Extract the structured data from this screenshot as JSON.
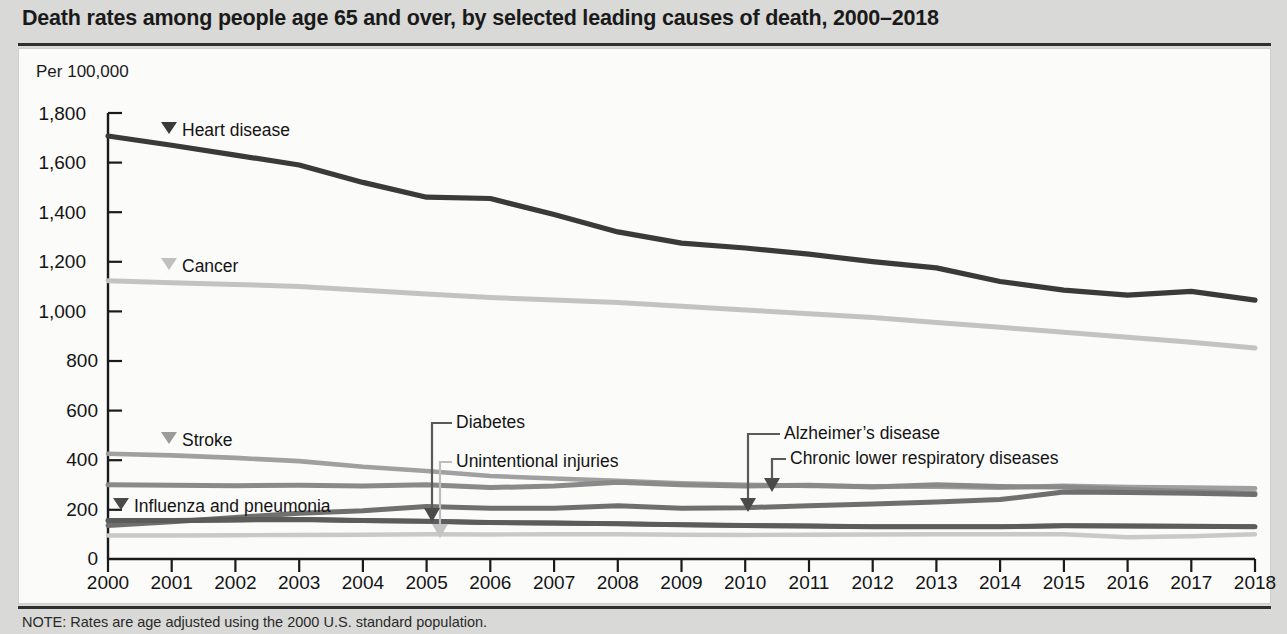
{
  "title": "Death rates among people age 65 and over, by selected leading causes of death, 2000–2018",
  "note": "NOTE: Rates are age adjusted using the 2000 U.S. standard population.",
  "axis_unit": "Per 100,000",
  "labels": {
    "heart": "Heart disease",
    "cancer": "Cancer",
    "stroke": "Stroke",
    "influenza": "Influenza and pneumonia",
    "diabetes": "Diabetes",
    "unintentional": "Unintentional injuries",
    "alzheimers": "Alzheimer’s disease",
    "clrd": "Chronic lower respiratory diseases"
  },
  "colors": {
    "heart": "#3a3a3a",
    "cancer": "#c3c3c3",
    "stroke": "#a0a0a0",
    "influenza": "#5c5c5c",
    "diabetes": "#4a4a4a",
    "unintentional": "#c9c9c9",
    "alzheimers": "#6f6f6f",
    "clrd": "#8a8a8a",
    "axis": "#1a1a1a",
    "panel_bg": "#fbfbfa",
    "page_bg": "#d9d9d7"
  },
  "chart_data": {
    "type": "line",
    "title": "Death rates among people age 65 and over, by selected leading causes of death, 2000–2018",
    "xlabel": "",
    "ylabel": "Per 100,000",
    "ylim": [
      0,
      1800
    ],
    "yticks": [
      0,
      200,
      400,
      600,
      800,
      1000,
      1200,
      1400,
      1600,
      1800
    ],
    "ytick_labels": [
      "0",
      "200",
      "400",
      "600",
      "800",
      "1,000",
      "1,200",
      "1,400",
      "1,600",
      "1,800"
    ],
    "grid": false,
    "legend": "inline-labels",
    "x": [
      2000,
      2001,
      2002,
      2003,
      2004,
      2005,
      2006,
      2007,
      2008,
      2009,
      2010,
      2011,
      2012,
      2013,
      2014,
      2015,
      2016,
      2017,
      2018
    ],
    "xtick_labels": [
      "2000",
      "2001",
      "2002",
      "2003",
      "2004",
      "2005",
      "2006",
      "2007",
      "2008",
      "2009",
      "2010",
      "2011",
      "2012",
      "2013",
      "2014",
      "2015",
      "2016",
      "2017",
      "2018"
    ],
    "series": [
      {
        "name": "Heart disease",
        "color": "#3a3a3a",
        "values": [
          1707,
          1670,
          1630,
          1590,
          1520,
          1460,
          1455,
          1390,
          1320,
          1275,
          1255,
          1230,
          1200,
          1175,
          1120,
          1085,
          1065,
          1080,
          1045
        ]
      },
      {
        "name": "Cancer",
        "color": "#c3c3c3",
        "values": [
          1123,
          1115,
          1108,
          1100,
          1085,
          1070,
          1055,
          1045,
          1035,
          1020,
          1005,
          990,
          975,
          955,
          935,
          915,
          895,
          875,
          851
        ]
      },
      {
        "name": "Stroke",
        "color": "#a0a0a0",
        "values": [
          425,
          418,
          408,
          395,
          372,
          355,
          335,
          325,
          315,
          305,
          300,
          295,
          293,
          292,
          288,
          295,
          290,
          288,
          285
        ]
      },
      {
        "name": "Chronic lower respiratory diseases",
        "color": "#8a8a8a",
        "values": [
          300,
          298,
          296,
          298,
          295,
          300,
          288,
          295,
          310,
          300,
          295,
          298,
          290,
          300,
          292,
          290,
          280,
          272,
          265
        ]
      },
      {
        "name": "Alzheimer's disease",
        "color": "#6f6f6f",
        "values": [
          135,
          150,
          168,
          185,
          195,
          212,
          205,
          205,
          215,
          205,
          207,
          215,
          222,
          230,
          240,
          270,
          268,
          265,
          260
        ]
      },
      {
        "name": "Diabetes",
        "color": "#4a4a4a",
        "values": [
          155,
          155,
          158,
          160,
          155,
          152,
          147,
          145,
          142,
          138,
          135,
          133,
          130,
          130,
          130,
          134,
          133,
          132,
          130
        ]
      },
      {
        "name": "Influenza and pneumonia",
        "color": "#5c5c5c",
        "values": [
          155,
          155,
          158,
          160,
          155,
          152,
          147,
          145,
          142,
          138,
          135,
          133,
          130,
          130,
          130,
          134,
          133,
          132,
          130
        ]
      },
      {
        "name": "Unintentional injuries",
        "color": "#c9c9c9",
        "values": [
          95,
          95,
          96,
          97,
          98,
          100,
          99,
          100,
          100,
          98,
          97,
          98,
          99,
          100,
          100,
          100,
          88,
          92,
          100
        ]
      }
    ]
  }
}
